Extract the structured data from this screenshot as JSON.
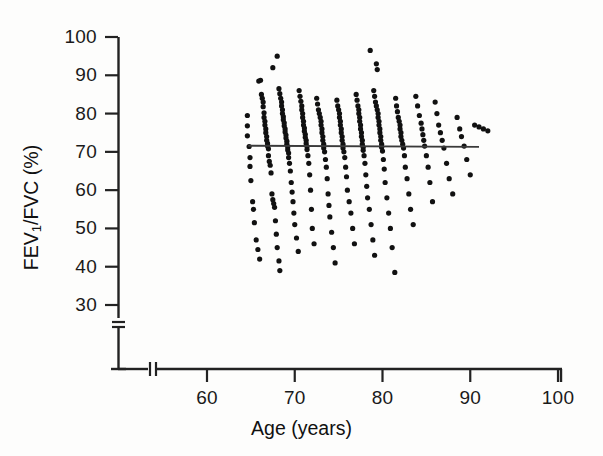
{
  "chart_data": {
    "type": "scatter",
    "title": "",
    "xlabel": "Age (years)",
    "ylabel": "FEV1/FVC (%)",
    "ylabel_base": "FEV",
    "ylabel_sub": "1",
    "ylabel_rest": "/FVC (%)",
    "xlim": [
      55,
      100
    ],
    "ylim": [
      27,
      100
    ],
    "xticks": [
      60,
      70,
      80,
      90,
      100
    ],
    "yticks": [
      30,
      40,
      50,
      60,
      70,
      80,
      90,
      100
    ],
    "xtick_labels": [
      "60",
      "70",
      "80",
      "90",
      "100"
    ],
    "ytick_labels": [
      "30",
      "40",
      "50",
      "60",
      "70",
      "80",
      "90",
      "100"
    ],
    "grid": false,
    "legend": "none",
    "axis_break_x": true,
    "axis_break_y": true,
    "marker": "filled-circle",
    "marker_color": "#111111",
    "marker_size_px": 5.2,
    "line_color": "#333333",
    "axis_color": "#222222",
    "n_points": 283,
    "trendline": {
      "type": "linear-regression",
      "x_start": 64.7,
      "x_end": 91.0,
      "y_start": 71.6,
      "y_end": 71.3,
      "slope_per_year": -0.011,
      "intercept": 72.3,
      "description": "near-flat horizontal regression line"
    },
    "points": [
      [
        64.6,
        79.5
      ],
      [
        64.6,
        76.8
      ],
      [
        64.6,
        74.2
      ],
      [
        64.8,
        71.4
      ],
      [
        64.9,
        68.5
      ],
      [
        64.9,
        66.2
      ],
      [
        65.0,
        62.5
      ],
      [
        65.2,
        57.0
      ],
      [
        65.3,
        55.0
      ],
      [
        65.4,
        51.5
      ],
      [
        65.6,
        47.0
      ],
      [
        65.8,
        44.5
      ],
      [
        66.0,
        42.0
      ],
      [
        65.9,
        88.5
      ],
      [
        66.1,
        88.7
      ],
      [
        66.2,
        85.0
      ],
      [
        66.3,
        84.0
      ],
      [
        66.4,
        83.0
      ],
      [
        66.4,
        81.8
      ],
      [
        66.5,
        80.2
      ],
      [
        66.5,
        79.0
      ],
      [
        66.6,
        78.0
      ],
      [
        66.6,
        77.0
      ],
      [
        66.7,
        76.0
      ],
      [
        66.7,
        75.0
      ],
      [
        66.8,
        74.0
      ],
      [
        66.8,
        73.0
      ],
      [
        66.9,
        72.2
      ],
      [
        66.9,
        71.5
      ],
      [
        67.0,
        70.8
      ],
      [
        67.0,
        69.0
      ],
      [
        67.1,
        67.5
      ],
      [
        67.2,
        66.5
      ],
      [
        67.3,
        64.5
      ],
      [
        67.4,
        59.0
      ],
      [
        67.5,
        57.5
      ],
      [
        67.6,
        56.5
      ],
      [
        67.7,
        55.5
      ],
      [
        67.8,
        52.0
      ],
      [
        67.9,
        48.5
      ],
      [
        68.0,
        45.0
      ],
      [
        68.2,
        41.5
      ],
      [
        68.3,
        39.0
      ],
      [
        67.5,
        92.0
      ],
      [
        68.0,
        95.0
      ],
      [
        68.2,
        86.5
      ],
      [
        68.3,
        85.2
      ],
      [
        68.4,
        84.0
      ],
      [
        68.5,
        83.0
      ],
      [
        68.5,
        82.0
      ],
      [
        68.6,
        81.0
      ],
      [
        68.6,
        80.0
      ],
      [
        68.7,
        79.2
      ],
      [
        68.7,
        78.4
      ],
      [
        68.8,
        77.6
      ],
      [
        68.8,
        76.8
      ],
      [
        68.9,
        76.0
      ],
      [
        68.9,
        75.2
      ],
      [
        69.0,
        74.4
      ],
      [
        69.0,
        73.6
      ],
      [
        69.1,
        72.8
      ],
      [
        69.1,
        72.0
      ],
      [
        69.2,
        71.3
      ],
      [
        69.2,
        70.5
      ],
      [
        69.3,
        69.7
      ],
      [
        69.3,
        68.5
      ],
      [
        69.4,
        67.0
      ],
      [
        69.5,
        65.0
      ],
      [
        69.6,
        62.0
      ],
      [
        69.7,
        59.5
      ],
      [
        69.8,
        57.0
      ],
      [
        69.9,
        54.0
      ],
      [
        70.0,
        51.0
      ],
      [
        70.2,
        47.5
      ],
      [
        70.4,
        44.0
      ],
      [
        70.5,
        86.0
      ],
      [
        70.6,
        84.5
      ],
      [
        70.7,
        83.2
      ],
      [
        70.8,
        82.0
      ],
      [
        70.8,
        81.0
      ],
      [
        70.9,
        80.0
      ],
      [
        70.9,
        79.0
      ],
      [
        71.0,
        78.0
      ],
      [
        71.0,
        77.0
      ],
      [
        71.1,
        76.2
      ],
      [
        71.1,
        75.4
      ],
      [
        71.2,
        74.6
      ],
      [
        71.2,
        73.8
      ],
      [
        71.3,
        73.0
      ],
      [
        71.3,
        72.2
      ],
      [
        71.4,
        71.4
      ],
      [
        71.4,
        70.6
      ],
      [
        71.5,
        69.0
      ],
      [
        71.6,
        67.0
      ],
      [
        71.7,
        64.0
      ],
      [
        71.8,
        60.0
      ],
      [
        71.9,
        55.0
      ],
      [
        72.0,
        50.0
      ],
      [
        72.2,
        46.0
      ],
      [
        72.5,
        84.0
      ],
      [
        72.6,
        82.5
      ],
      [
        72.7,
        81.0
      ],
      [
        72.8,
        80.0
      ],
      [
        72.9,
        79.0
      ],
      [
        73.0,
        78.0
      ],
      [
        73.0,
        77.0
      ],
      [
        73.1,
        76.0
      ],
      [
        73.1,
        75.0
      ],
      [
        73.2,
        74.0
      ],
      [
        73.2,
        73.0
      ],
      [
        73.3,
        72.0
      ],
      [
        73.3,
        71.0
      ],
      [
        73.4,
        70.0
      ],
      [
        73.5,
        68.0
      ],
      [
        73.6,
        66.0
      ],
      [
        73.7,
        63.0
      ],
      [
        73.8,
        59.0
      ],
      [
        73.9,
        56.0
      ],
      [
        74.0,
        53.0
      ],
      [
        74.2,
        49.0
      ],
      [
        74.4,
        45.0
      ],
      [
        74.6,
        41.0
      ],
      [
        74.8,
        83.5
      ],
      [
        74.9,
        82.0
      ],
      [
        75.0,
        81.0
      ],
      [
        75.1,
        80.0
      ],
      [
        75.1,
        79.0
      ],
      [
        75.2,
        78.0
      ],
      [
        75.2,
        77.0
      ],
      [
        75.3,
        76.0
      ],
      [
        75.3,
        75.0
      ],
      [
        75.4,
        74.0
      ],
      [
        75.4,
        73.0
      ],
      [
        75.5,
        72.0
      ],
      [
        75.5,
        71.0
      ],
      [
        75.6,
        70.0
      ],
      [
        75.7,
        68.5
      ],
      [
        75.8,
        66.0
      ],
      [
        75.9,
        63.5
      ],
      [
        76.0,
        60.0
      ],
      [
        76.2,
        57.0
      ],
      [
        76.4,
        54.0
      ],
      [
        76.6,
        50.0
      ],
      [
        76.8,
        46.0
      ],
      [
        77.0,
        85.0
      ],
      [
        77.1,
        83.5
      ],
      [
        77.2,
        82.0
      ],
      [
        77.3,
        81.0
      ],
      [
        77.3,
        80.0
      ],
      [
        77.4,
        79.0
      ],
      [
        77.4,
        78.0
      ],
      [
        77.5,
        77.0
      ],
      [
        77.5,
        76.0
      ],
      [
        77.6,
        75.0
      ],
      [
        77.6,
        74.0
      ],
      [
        77.7,
        73.0
      ],
      [
        77.7,
        72.0
      ],
      [
        77.8,
        71.2
      ],
      [
        77.8,
        70.4
      ],
      [
        77.9,
        69.0
      ],
      [
        78.0,
        67.0
      ],
      [
        78.1,
        64.0
      ],
      [
        78.2,
        61.0
      ],
      [
        78.3,
        58.0
      ],
      [
        78.5,
        55.0
      ],
      [
        78.7,
        51.0
      ],
      [
        78.9,
        47.0
      ],
      [
        79.1,
        43.0
      ],
      [
        78.6,
        96.5
      ],
      [
        79.3,
        93.0
      ],
      [
        79.4,
        91.5
      ],
      [
        79.0,
        86.0
      ],
      [
        79.1,
        84.5
      ],
      [
        79.2,
        83.0
      ],
      [
        79.3,
        82.0
      ],
      [
        79.4,
        81.0
      ],
      [
        79.5,
        80.0
      ],
      [
        79.5,
        79.0
      ],
      [
        79.6,
        78.0
      ],
      [
        79.6,
        77.0
      ],
      [
        79.7,
        76.0
      ],
      [
        79.7,
        75.0
      ],
      [
        79.8,
        74.0
      ],
      [
        79.8,
        73.0
      ],
      [
        79.9,
        72.0
      ],
      [
        79.9,
        71.2
      ],
      [
        80.0,
        70.2
      ],
      [
        80.1,
        68.0
      ],
      [
        80.2,
        65.5
      ],
      [
        80.3,
        62.0
      ],
      [
        80.5,
        58.0
      ],
      [
        80.7,
        54.0
      ],
      [
        80.9,
        50.0
      ],
      [
        81.1,
        45.0
      ],
      [
        81.4,
        38.5
      ],
      [
        81.5,
        84.0
      ],
      [
        81.6,
        82.0
      ],
      [
        81.7,
        80.5
      ],
      [
        81.8,
        79.0
      ],
      [
        81.9,
        78.0
      ],
      [
        82.0,
        77.0
      ],
      [
        82.0,
        76.0
      ],
      [
        82.1,
        75.0
      ],
      [
        82.1,
        74.0
      ],
      [
        82.2,
        73.0
      ],
      [
        82.3,
        72.0
      ],
      [
        82.4,
        71.0
      ],
      [
        82.5,
        69.0
      ],
      [
        82.6,
        66.0
      ],
      [
        82.8,
        63.0
      ],
      [
        83.0,
        59.0
      ],
      [
        83.2,
        55.0
      ],
      [
        83.5,
        51.0
      ],
      [
        83.8,
        84.5
      ],
      [
        84.0,
        82.0
      ],
      [
        84.2,
        79.5
      ],
      [
        84.4,
        77.5
      ],
      [
        84.5,
        76.0
      ],
      [
        84.6,
        74.5
      ],
      [
        84.7,
        73.0
      ],
      [
        84.8,
        71.5
      ],
      [
        85.0,
        69.0
      ],
      [
        85.2,
        66.0
      ],
      [
        85.4,
        62.0
      ],
      [
        85.7,
        57.0
      ],
      [
        86.0,
        83.0
      ],
      [
        86.2,
        80.0
      ],
      [
        86.4,
        77.0
      ],
      [
        86.6,
        75.0
      ],
      [
        86.8,
        73.0
      ],
      [
        87.0,
        71.0
      ],
      [
        87.3,
        67.0
      ],
      [
        87.6,
        63.0
      ],
      [
        88.0,
        59.0
      ],
      [
        88.5,
        79.0
      ],
      [
        88.8,
        76.0
      ],
      [
        89.0,
        74.0
      ],
      [
        89.3,
        71.5
      ],
      [
        89.6,
        68.0
      ],
      [
        90.0,
        64.0
      ],
      [
        90.5,
        77.0
      ],
      [
        91.0,
        76.5
      ],
      [
        91.5,
        76.0
      ],
      [
        92.0,
        75.5
      ]
    ]
  },
  "axes": {
    "y_title_base": "FEV",
    "y_title_sub": "1",
    "y_title_rest": "/FVC (%)",
    "x_title": "Age (years)"
  }
}
